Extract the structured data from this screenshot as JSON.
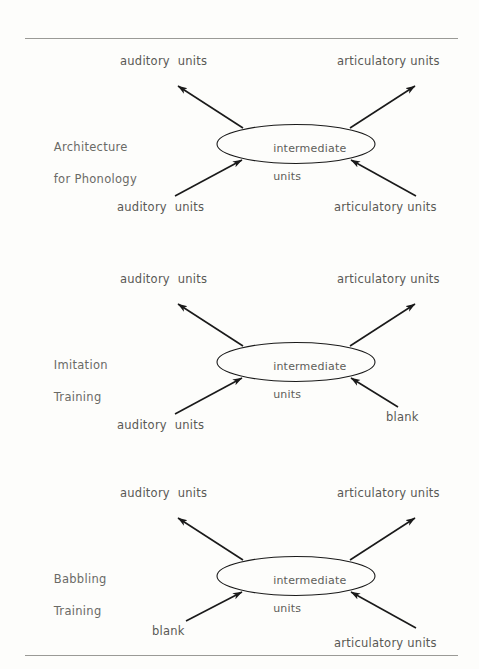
{
  "page": {
    "background_color": "#fdfdfb",
    "rule_color": "#9a9a96",
    "text_color": "#595955",
    "stroke_color": "#1a1a1a"
  },
  "blocks": [
    {
      "id": "architecture-for-phonology",
      "section_label_line1": "Architecture",
      "section_label_line2": "for Phonology",
      "node_label_line1": "intermediate",
      "node_label_line2": "units",
      "top_left_label": "auditory  units",
      "top_right_label": "articulatory units",
      "bottom_left_label": "auditory  units",
      "bottom_right_label": "articulatory units"
    },
    {
      "id": "imitation-training",
      "section_label_line1": "Imitation",
      "section_label_line2": "Training",
      "node_label_line1": "intermediate",
      "node_label_line2": "units",
      "top_left_label": "auditory  units",
      "top_right_label": "articulatory units",
      "bottom_left_label": "auditory  units",
      "bottom_right_label": "blank"
    },
    {
      "id": "babbling-training",
      "section_label_line1": "Babbling",
      "section_label_line2": "Training",
      "node_label_line1": "intermediate",
      "node_label_line2": "units",
      "top_left_label": "auditory  units",
      "top_right_label": "articulatory units",
      "bottom_left_label": "blank",
      "bottom_right_label": "articulatory units"
    }
  ]
}
